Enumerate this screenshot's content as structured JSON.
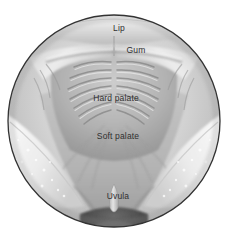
{
  "figure": {
    "frame_shape": "circle",
    "style": "grayscale medical illustration"
  },
  "colors": {
    "background": "#ffffff",
    "frame_outline": "#333333",
    "label_text": "#2f2f2f",
    "tissue_light": "#f2f2f2",
    "tissue_mid": "#b8b8b8",
    "tissue_dark": "#8c8c8c",
    "throat_dark": "#3f3f3f",
    "cheek_pale": "#ededed"
  },
  "labels": {
    "lip": "Lip",
    "gum": "Gum",
    "hard_palate": "Hard palate",
    "soft_palate": "Soft palate",
    "uvula": "Uvula"
  },
  "structures": {
    "lip": "upper lip retracted",
    "gum": "upper gingiva arch",
    "hard_palate": "palatal rugae ridges",
    "soft_palate": "posterior palate",
    "uvula": "midline uvula",
    "throat": "oropharyngeal opening",
    "raphe": "median palatine raphe",
    "frenulum": "labial frenulum",
    "cheek_left": "left buccal mucosa",
    "cheek_right": "right buccal mucosa"
  }
}
